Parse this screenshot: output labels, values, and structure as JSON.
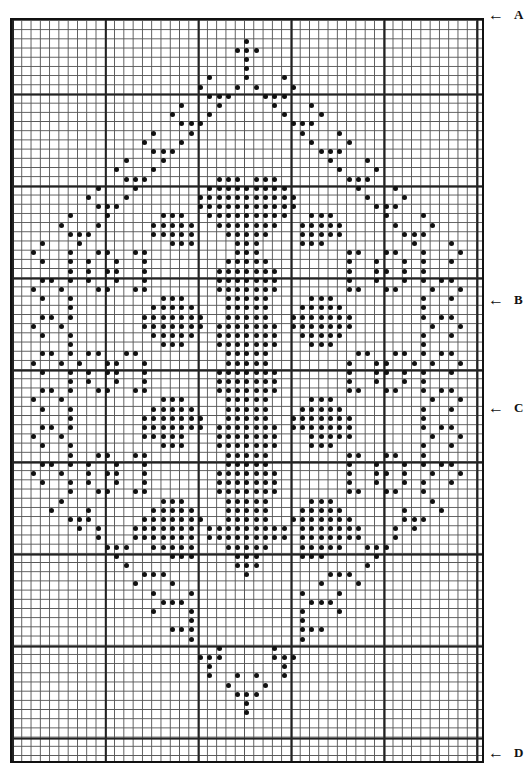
{
  "chart": {
    "type": "filet-crochet-grid",
    "columns": 51,
    "rows": 81,
    "origin_px": [
      10,
      18
    ],
    "cell_px": [
      9.29,
      9.2
    ],
    "dot_color": "#111111",
    "grid_color": "#222222",
    "rows_left_half": [
      "..........................",
      "..........................",
      ".........................#",
      "........................##",
      ".........................#",
      ".........................#",
      ".....................#...#",
      "....................#...#.",
      ".....................###..",
      "..................#...#...",
      ".................#...#....",
      "..................###.....",
      "...............#...#......",
      "..............#...#.......",
      "...............###........",
      "............#...#.........",
      "...........#...#..........",
      "............###.......###.",
      ".........#...#.......#####",
      "........#...#.......######",
      ".........###........######",
      "......#...#.....###..#####",
      ".....#...#.....#####..####",
      "......###......#####...###",
      "...#...#.........###....##",
      "..#...#..##..##.........##",
      "...#..#.#..#..#........###",
      "......#.#.##..#.......####",
      "...##.#.#..#..#.......####",
      "..#..#...##..##.......####",
      "...#..#.........###....###",
      "......#........#####...###",
      "...##.#.......#######..###",
      "..#..#........#######.####",
      "...#..#........#####..####",
      "......#.........###...####",
      "...##.#.##..##.........###",
      "..#..#.#..##..#........###",
      "...#..#.#.##..#.......####",
      "......#.#..#..#.......####",
      "...##.#..##..##.......####",
      "..#..#..........###....###",
      "...#..#........#####...###",
      "......#.......#######..###",
      "...##.#.......#######.####",
      "..#..#........#####...####",
      "...#..#.........###...####",
      "......#..##..##........###",
      "...##.#.#..#..#........###",
      "..#..#..#.##..#.......####",
      "...#..#.#..#..#.......####",
      "......#..##..##.......####",
      ".....#..........###....###",
      "....#...#......#####...###",
      "......###.....#######..###",
      ".......#.#...#######.#####",
      ".........#...#######.#####",
      "..........###..#####...###",
      "...........#.....###....##",
      "............#...........##",
      "..............###........#",
      ".............#...#........",
      "...............#...#......",
      "................###.......",
      "...............#...#......",
      "...................#......",
      ".................###......",
      "...................#......",
      "......................#...",
      "....................###...",
      ".....................#....",
      ".....................#..#.",
      ".......................#..",
      "........................##",
      ".........................#",
      ".........................#",
      "..........................",
      "..........................",
      "..........................",
      "..........................",
      ".........................."
    ]
  },
  "markers": [
    {
      "label": "A",
      "arrow": "←",
      "y": 14
    },
    {
      "label": "B",
      "arrow": "←",
      "y": 300
    },
    {
      "label": "C",
      "arrow": "←",
      "y": 408
    },
    {
      "label": "D",
      "arrow": "←",
      "y": 753
    }
  ]
}
